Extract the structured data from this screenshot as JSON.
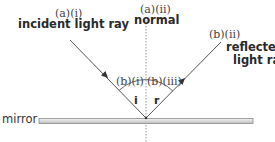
{
  "diagram": {
    "labels": {
      "incident_tag": "(a)(i)",
      "incident_name": "incident light ray",
      "normal_tag": "(a)(ii)",
      "normal_name": "normal",
      "reflected_tag": "(b)(ii)",
      "reflected_name_line1": "reflected",
      "reflected_name_line2": "light ray",
      "angle_i_tag": "(b)(i)",
      "angle_r_tag": "(b)(iii)",
      "angle_i_symbol": "i",
      "angle_r_symbol": "r",
      "mirror": "mirror"
    },
    "colors": {
      "ray": "#555555",
      "normal": "#888888",
      "mirror_fill": "#e2e2e2",
      "mirror_edge": "#8a8a8a",
      "text": "#333333"
    }
  }
}
